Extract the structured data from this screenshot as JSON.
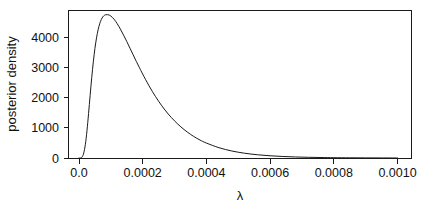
{
  "chart_data": {
    "type": "line",
    "title": "",
    "subtitle": "",
    "xlabel": "λ",
    "ylabel": "posterior density",
    "xlim": [
      0.0,
      0.001
    ],
    "ylim": [
      0,
      4780
    ],
    "grid": false,
    "legend": "none",
    "xticks": [
      0.0,
      0.0002,
      0.0004,
      0.0006,
      0.0008,
      0.001
    ],
    "xticklabels": [
      "0.0",
      "0.0002",
      "0.0004",
      "0.0006",
      "0.0008",
      "0.0010"
    ],
    "yticks": [
      0,
      1000,
      2000,
      3000,
      4000
    ],
    "yticklabels": [
      "0",
      "1000",
      "2000",
      "3000",
      "4000"
    ],
    "series": [
      {
        "name": "posterior density",
        "color": "#1a1a1a",
        "peak_x": 9e-05,
        "peak_y": 4750,
        "x": [
          0.0,
          5e-06,
          1e-05,
          1.5e-05,
          2e-05,
          2.5e-05,
          3e-05,
          3.5e-05,
          4e-05,
          4.5e-05,
          5e-05,
          5.5e-05,
          6e-05,
          6.5e-05,
          7e-05,
          7.5e-05,
          8e-05,
          8.5e-05,
          9e-05,
          9.5e-05,
          0.0001,
          0.00011,
          0.00012,
          0.00013,
          0.00014,
          0.00015,
          0.00016,
          0.00017,
          0.00018,
          0.00019,
          0.0002,
          0.00022,
          0.00024,
          0.00026,
          0.00028,
          0.0003,
          0.00032,
          0.00034,
          0.00036,
          0.00038,
          0.0004,
          0.00044,
          0.00048,
          0.00052,
          0.00056,
          0.0006,
          0.00064,
          0.00068,
          0.00072,
          0.00076,
          0.0008,
          0.00085,
          0.0009,
          0.00095,
          0.001
        ],
        "y": [
          0,
          2,
          35,
          170,
          450,
          900,
          1470,
          2080,
          2670,
          3190,
          3630,
          3980,
          4250,
          4450,
          4590,
          4680,
          4730,
          4750,
          4750,
          4735,
          4705,
          4600,
          4450,
          4270,
          4070,
          3860,
          3640,
          3420,
          3200,
          2990,
          2780,
          2390,
          2040,
          1730,
          1460,
          1230,
          1030,
          860,
          715,
          595,
          495,
          340,
          232,
          158,
          108,
          74,
          50,
          34,
          23,
          16,
          11,
          6.5,
          4,
          2.4,
          1.5
        ]
      },
      {
        "name": "baseline",
        "color": "#1a1a1a",
        "x": [
          0.0,
          0.001
        ],
        "y": [
          0,
          0
        ]
      }
    ]
  },
  "axes": {
    "y_title": "posterior density",
    "x_title": "λ"
  }
}
